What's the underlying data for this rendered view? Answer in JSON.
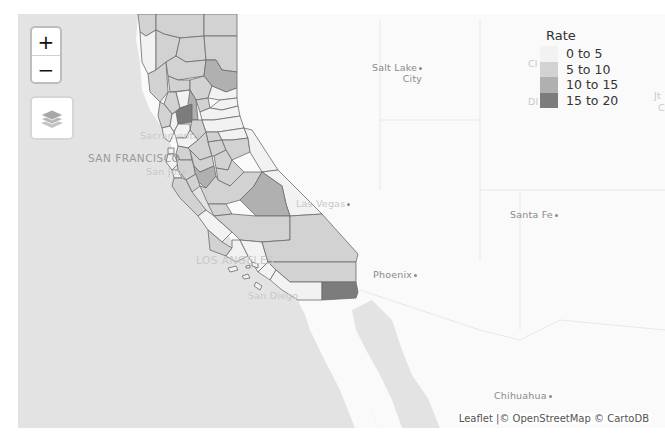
{
  "map": {
    "controls": {
      "zoom_in_label": "+",
      "zoom_out_label": "−",
      "layers_icon": "layers-icon"
    },
    "colors": {
      "ocean": "#e3e3e3",
      "land": "#fafafa",
      "border": "#6b6b6b",
      "rate_0_5": "#f2f2f2",
      "rate_5_10": "#d2d2d2",
      "rate_10_15": "#b0b0b0",
      "rate_15_20": "#7c7c7c"
    },
    "cities": [
      {
        "name": "Salt Lake",
        "name2": "City"
      },
      {
        "name": "Sacramento"
      },
      {
        "name": "SAN FRANCISCO"
      },
      {
        "name": "San Jose"
      },
      {
        "name": "Las Vegas"
      },
      {
        "name": "Santa Fe"
      },
      {
        "name": "LOS ANGELES"
      },
      {
        "name": "Phoenix"
      },
      {
        "name": "San Diego"
      },
      {
        "name": "Chihuahua"
      }
    ],
    "edge_labels": [
      "Cl",
      "Dl",
      "Jt",
      "C"
    ]
  },
  "legend": {
    "title": "Rate",
    "items": [
      {
        "label": "0 to 5",
        "color": "#f2f2f2"
      },
      {
        "label": "5 to 10",
        "color": "#d2d2d2"
      },
      {
        "label": "10 to 15",
        "color": "#b0b0b0"
      },
      {
        "label": "15 to 20",
        "color": "#7c7c7c"
      }
    ]
  },
  "attribution": {
    "leaflet": "Leaflet",
    "separator": " |© ",
    "osm": "OpenStreetMap",
    "carto": " © CartoDB"
  }
}
